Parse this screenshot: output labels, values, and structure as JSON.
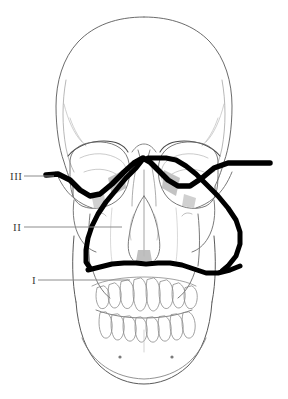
{
  "figure": {
    "background_color": "#ffffff",
    "line_color": "#555555",
    "fracture_color": "#000000",
    "shading_color": "#b9b9b9",
    "label_color": "#3a3a3a",
    "leader_color": "#8c8c8c"
  },
  "labels": [
    {
      "id": "le-fort-3",
      "text": "III",
      "x": 12,
      "y": 180,
      "leader": {
        "x1": 24,
        "y1": 176,
        "x2": 54,
        "y2": 176
      }
    },
    {
      "id": "le-fort-2",
      "text": "II",
      "x": 14,
      "y": 231,
      "leader": {
        "x1": 24,
        "y1": 227,
        "x2": 122,
        "y2": 227
      }
    },
    {
      "id": "le-fort-1",
      "text": "I",
      "x": 32,
      "y": 284,
      "leader": {
        "x1": 38,
        "y1": 280,
        "x2": 130,
        "y2": 280
      }
    }
  ],
  "fracture_lines": [
    {
      "id": "le-fort-3-line",
      "label": "III",
      "stroke_width": 5.5,
      "path": "M 46 175 L 58 174 L 70 180 L 80 190 L 90 196 L 100 194 L 112 184 L 124 172 L 134 163 L 143 158 L 150 162 L 158 170 L 168 180 L 178 186 L 190 186 L 202 178 L 214 168 L 228 163 L 244 163 L 258 163 L 270 163"
    },
    {
      "id": "le-fort-2-line",
      "label": "II",
      "stroke_width": 5.0,
      "path": "M 143 159 L 136 168 L 126 178 L 116 190 L 106 202 L 98 214 L 92 226 L 88 238 L 86 250 L 86 262 L 90 268 L 100 266 L 112 263 L 124 262 L 136 262 L 146 263 L 158 262 L 170 262 L 182 264 L 194 268 L 206 272 L 218 272 L 228 266 L 236 256 L 240 244 L 240 232 L 236 220 L 228 208 L 218 196 L 206 184 L 196 174 L 186 166 L 176 160 L 166 158 L 156 158 L 148 158"
    },
    {
      "id": "le-fort-1-line",
      "label": "I",
      "stroke_width": 5.0,
      "path": "M 88 270 L 100 267 L 112 264 L 124 263 L 136 263 L 146 264 L 158 263 L 170 263 L 182 265 L 194 269 L 206 273 L 218 273 L 230 270 L 240 266"
    }
  ],
  "anatomy": {
    "cranium_outline": "M 144 18 C 100 18 68 44 58 84 C 50 114 52 142 58 164 C 62 180 68 192 74 200 L 74 236 C 74 252 80 264 90 272 L 90 290 C 90 320 106 348 124 366 C 132 376 140 382 144 384 C 148 382 156 376 164 366 C 182 348 198 320 198 290 L 198 272 C 208 264 214 252 214 236 L 214 200 C 220 192 226 180 230 164 C 236 142 238 114 230 84 C 220 44 188 18 144 18 Z",
    "left_orbit": "M 66 160 C 66 148 76 142 92 141 C 108 140 122 146 126 158 C 130 170 128 186 120 196 C 112 206 96 210 84 206 C 72 202 66 190 66 176 Z",
    "right_orbit": "M 222 160 C 222 148 212 142 196 141 C 180 140 166 146 162 158 C 158 170 160 186 168 196 C 176 206 192 210 204 206 C 216 202 222 190 222 176 Z",
    "nasal_aperture": "M 144 196 C 138 204 132 220 130 236 C 128 248 130 256 134 260 L 144 258 L 154 260 C 158 256 160 248 158 236 C 156 220 150 204 144 196 Z",
    "nasal_septum": "M 144 172 L 144 258",
    "maxilla_left": "M 92 268 L 98 296 L 110 306",
    "maxilla_right": "M 196 268 L 190 296 L 178 306",
    "mandible_outline": "M 82 292 L 84 330 C 86 356 104 376 126 382 L 144 384 L 162 382 C 184 376 202 356 204 330 L 206 292",
    "upper_teeth_count": 14,
    "lower_teeth_count": 14,
    "mental_foramen_left": {
      "cx": 120,
      "cy": 357
    },
    "mental_foramen_right": {
      "cx": 172,
      "cy": 357
    }
  }
}
